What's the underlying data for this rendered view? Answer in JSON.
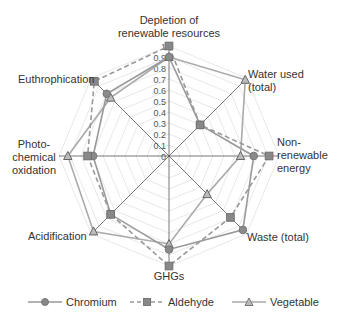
{
  "chart_data": {
    "type": "radar",
    "title": "",
    "categories": [
      "Depletion of renewable resources",
      "Water used (total)",
      "Non-renewable energy",
      "Waste (total)",
      "GHGs",
      "Acidification",
      "Photo-chemical oxidation",
      "Euthrophication"
    ],
    "category_labels": [
      "Depletion of\nrenewable resources",
      "Water used\n(total)",
      "Non-\nrenewable\nenergy",
      "Waste (total)",
      "GHGs",
      "Acidification",
      "Photo-\nchemical\noxidation",
      "Euthrophication"
    ],
    "radial_ticks": [
      "0",
      "0.1",
      "0.2",
      "0.3",
      "0.4",
      "0.5",
      "0.6",
      "0.7",
      "0.8",
      "0.9",
      "1"
    ],
    "rlim": [
      0,
      1
    ],
    "grid": true,
    "legend_position": "bottom",
    "series": [
      {
        "name": "Chromium",
        "marker": "circle",
        "line": "solid",
        "color": "#999999",
        "values": [
          0.9,
          0.4,
          0.77,
          0.95,
          0.85,
          0.75,
          0.69,
          0.8
        ]
      },
      {
        "name": "Aldehyde",
        "marker": "square",
        "line": "dashed",
        "color": "#999999",
        "values": [
          1.0,
          0.4,
          0.91,
          0.79,
          1.0,
          0.75,
          0.74,
          0.96
        ]
      },
      {
        "name": "Vegetable",
        "marker": "triangle",
        "line": "solid",
        "color": "#aaaaaa",
        "values": [
          0.9,
          0.98,
          0.65,
          0.49,
          0.8,
          0.97,
          0.92,
          0.75
        ]
      }
    ]
  },
  "legend": {
    "chromium": "Chromium",
    "aldehyde": "Aldehyde",
    "vegetable": "Vegetable"
  }
}
